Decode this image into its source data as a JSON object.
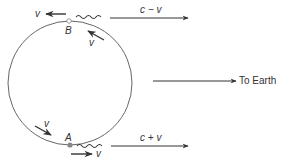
{
  "diagram": {
    "colors": {
      "stroke": "#333333",
      "circle": "#555555",
      "point": "#888888"
    },
    "labels": {
      "point_b": "B",
      "point_a": "A",
      "v_top_left": "v",
      "v_top_orbit": "v",
      "v_bottom_orbit": "v",
      "v_bottom_right": "v",
      "signal_top": "c − v",
      "signal_bottom": "c + v",
      "to_earth": "To Earth"
    }
  }
}
